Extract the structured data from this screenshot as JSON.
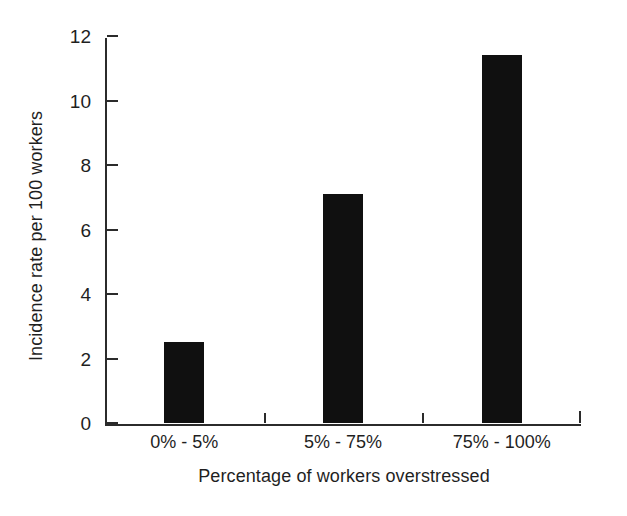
{
  "chart_data": {
    "type": "bar",
    "title": "",
    "categories": [
      "0% - 5%",
      "5% - 75%",
      "75% - 100%"
    ],
    "values": [
      2.5,
      7.1,
      11.4
    ],
    "xlabel": "Percentage of workers overstressed",
    "ylabel": "Incidence rate per 100 workers",
    "ylim": [
      0,
      12
    ],
    "yticks": [
      0,
      2,
      4,
      6,
      8,
      10,
      12
    ],
    "ytick_labels": [
      "0",
      "2",
      "4",
      "6",
      "8",
      "10",
      "12"
    ],
    "grid": false,
    "legend": null,
    "bar_color": "#101010",
    "axis_color": "#2b2b2b",
    "background": "#ffffff"
  }
}
